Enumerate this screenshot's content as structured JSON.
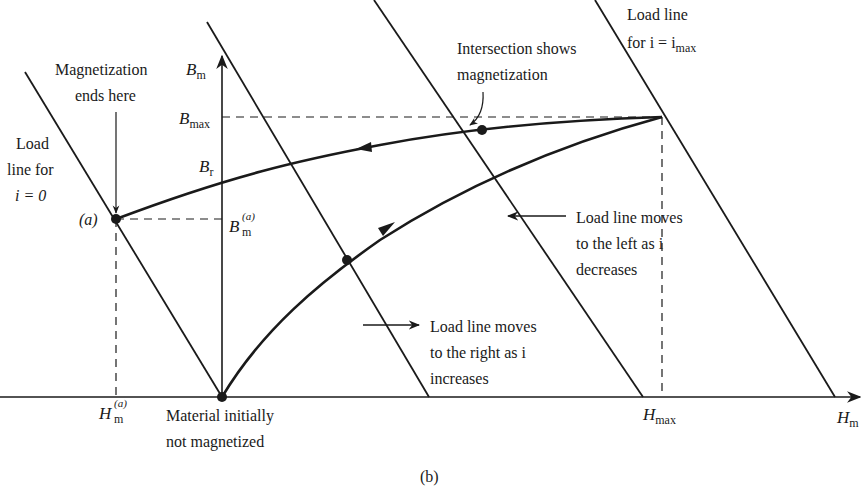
{
  "diagram": {
    "caption": "(b)",
    "axes": {
      "x": {
        "symbol": "H",
        "subscript": "m"
      },
      "y": {
        "symbol": "B",
        "subscript": "m"
      }
    },
    "axis_ticks": {
      "h_a": {
        "symbol": "H",
        "subscript": "m",
        "superscript": "(a)"
      },
      "h_max": {
        "symbol": "H",
        "subscript": "max"
      },
      "b_max": {
        "symbol": "B",
        "subscript": "max"
      },
      "b_r": {
        "symbol": "B",
        "subscript": "r"
      },
      "b_a": {
        "symbol": "B",
        "subscript": "m",
        "superscript": "(a)"
      }
    },
    "point_labels": {
      "a": "(a)"
    },
    "annotations": {
      "magnetization_ends": [
        "Magnetization",
        "ends here"
      ],
      "load_line_i0": [
        "Load",
        "line for",
        "i = 0"
      ],
      "load_line_imax": [
        "Load line",
        "for i = i",
        "max"
      ],
      "intersection": [
        "Intersection shows",
        "magnetization"
      ],
      "moves_left": [
        "Load line moves",
        "to the left as i",
        "decreases"
      ],
      "moves_right": [
        "Load line moves",
        "to the right as i",
        "increases"
      ],
      "initial": [
        "Material initially",
        "not magnetized"
      ]
    },
    "elements": {
      "load_lines": [
        {
          "name": "load-line-i-zero",
          "x1": 25,
          "y1": 72,
          "x2": 222,
          "y2": 397
        },
        {
          "name": "load-line-2",
          "x1": 207,
          "y1": 22,
          "x2": 429,
          "y2": 397
        },
        {
          "name": "load-line-3",
          "x1": 374,
          "y1": 0,
          "x2": 643,
          "y2": 397
        },
        {
          "name": "load-line-i-max",
          "x1": 595,
          "y1": 0,
          "x2": 835,
          "y2": 397
        }
      ],
      "points": {
        "origin": [
          222,
          397
        ],
        "a": [
          116,
          219
        ],
        "intersection": [
          482,
          130
        ],
        "rising": [
          347,
          260
        ],
        "max": [
          662,
          117
        ]
      }
    }
  }
}
